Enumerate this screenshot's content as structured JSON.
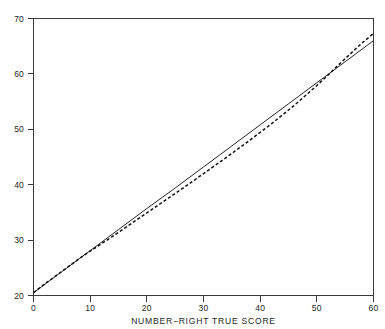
{
  "chart_data": {
    "type": "line",
    "title": "",
    "xlabel": "NUMBER−RIGHT TRUE SCORE",
    "ylabel": "",
    "xlim": [
      0,
      60
    ],
    "ylim": [
      20,
      70
    ],
    "xticks": [
      0,
      10,
      20,
      30,
      40,
      50,
      60
    ],
    "yticks": [
      20,
      30,
      40,
      50,
      60,
      70
    ],
    "xtick_labels": [
      "0",
      "10",
      "20",
      "30",
      "40",
      "50",
      "60"
    ],
    "ytick_labels": [
      "20",
      "30",
      "40",
      "50",
      "60",
      "70"
    ],
    "grid": false,
    "legend": "none",
    "frame": "box",
    "colors": {
      "axis": "#3a3a3a",
      "solid_line": "#262626",
      "dashed_line": "#101010",
      "background": "#ffffff",
      "text": "#262626"
    },
    "series": [
      {
        "name": "solid-line",
        "style": "solid",
        "x": [
          0,
          5,
          10,
          15,
          20,
          25,
          30,
          35,
          40,
          45,
          50,
          55,
          60
        ],
        "values": [
          20.5,
          24.3,
          28.1,
          31.9,
          35.7,
          39.4,
          43.2,
          47.0,
          50.8,
          54.6,
          58.4,
          62.2,
          66.0
        ]
      },
      {
        "name": "dashed-curve",
        "style": "dashed",
        "x": [
          0,
          2,
          4,
          6,
          8,
          10,
          14,
          18,
          22,
          26,
          30,
          34,
          38,
          42,
          46,
          50,
          52,
          54,
          56,
          58,
          60
        ],
        "values": [
          20.5,
          22.1,
          23.6,
          25.1,
          26.6,
          28.0,
          30.7,
          33.5,
          36.3,
          39.1,
          42.0,
          44.9,
          47.9,
          51.0,
          54.3,
          57.9,
          59.8,
          61.8,
          63.7,
          65.6,
          67.3
        ]
      }
    ]
  },
  "axis": {
    "x_title": "NUMBER−RIGHT TRUE SCORE"
  }
}
